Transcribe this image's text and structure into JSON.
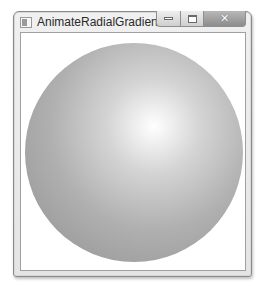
{
  "window": {
    "title": "AnimateRadialGradient",
    "controls": {
      "minimize_icon": "minimize-icon",
      "maximize_icon": "maximize-icon",
      "close_icon": "close-icon",
      "close_glyph": "✕"
    }
  },
  "content": {
    "shape": "ellipse",
    "gradient": {
      "type": "radial",
      "center_x_pct": 59,
      "center_y_pct": 38,
      "stops": [
        {
          "color": "#ffffff",
          "offset": 0
        },
        {
          "color": "#d4d4d4",
          "offset": 25
        },
        {
          "color": "#b0b0b0",
          "offset": 55
        },
        {
          "color": "#9a9a9a",
          "offset": 85
        }
      ]
    }
  }
}
